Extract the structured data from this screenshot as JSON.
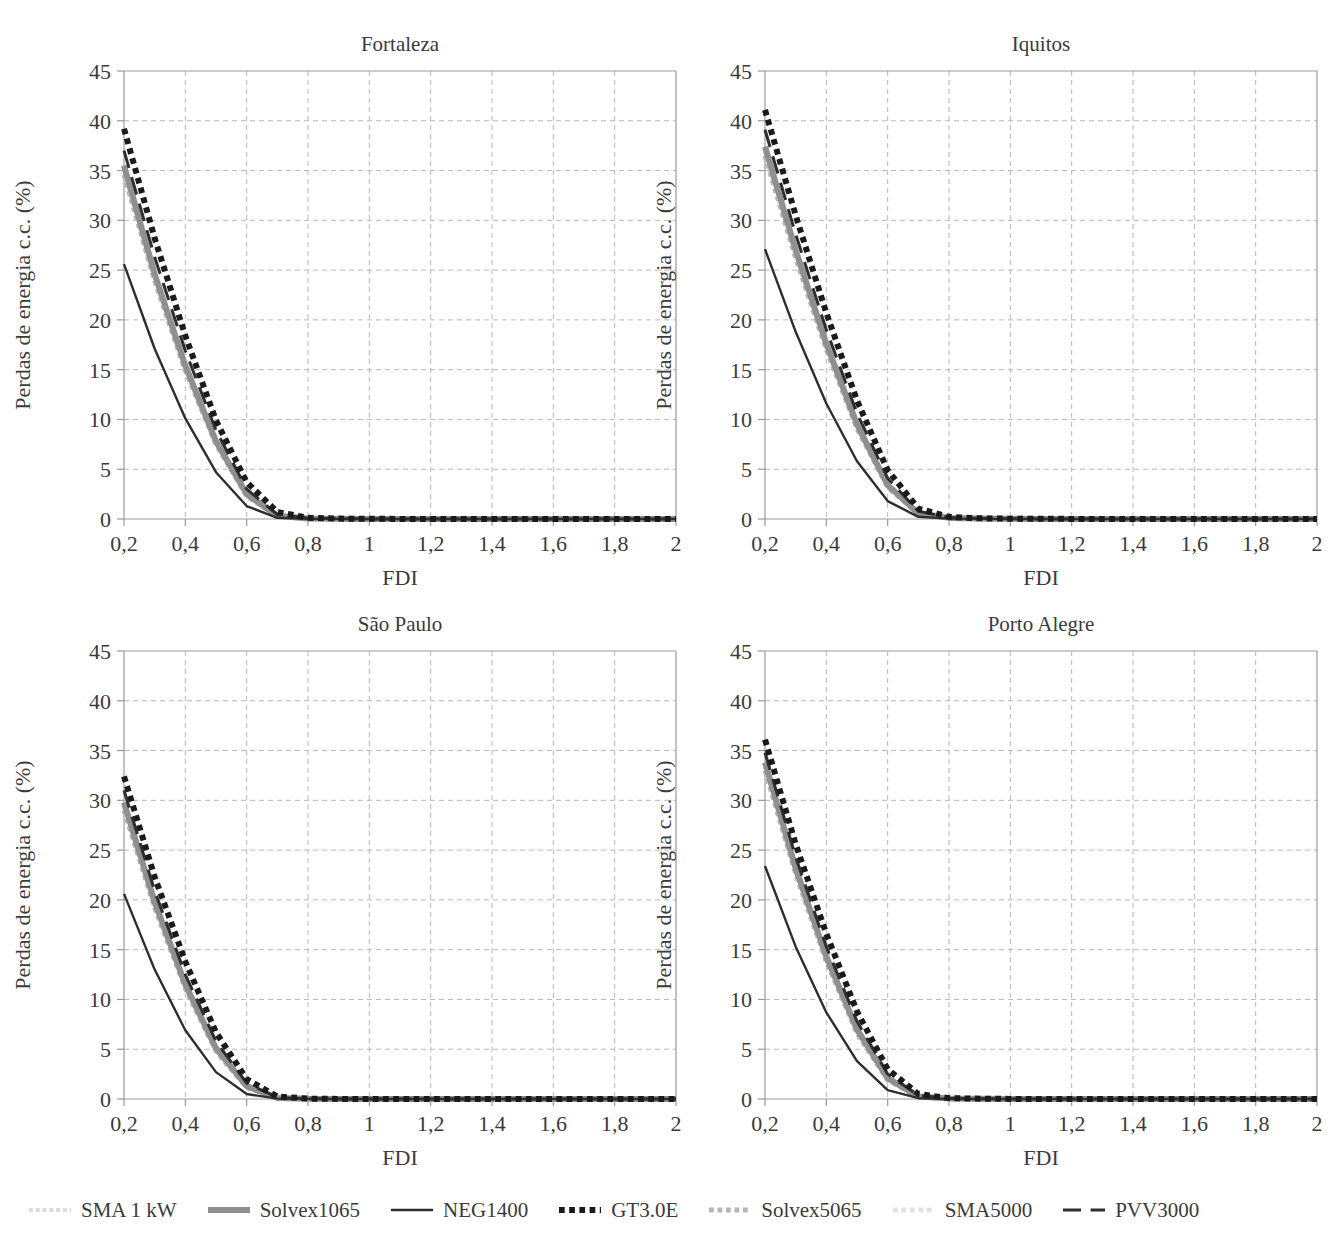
{
  "figure": {
    "background": "#ffffff",
    "axis_color": "#9a9a9a",
    "grid_color": "#b9b9b9",
    "text_color": "#3b3b3b"
  },
  "legend": {
    "position": "bottom",
    "items": [
      {
        "label": "SMA 1 kW",
        "color": "#d9d9d9",
        "style": "dotted",
        "width": 4
      },
      {
        "label": "Solvex1065",
        "color": "#8f8f8f",
        "style": "solid",
        "width": 6
      },
      {
        "label": "NEG1400",
        "color": "#2e2e2e",
        "style": "solid",
        "width": 2.4
      },
      {
        "label": "GT3.0E",
        "color": "#1a1a1a",
        "style": "dotted",
        "width": 6
      },
      {
        "label": "Solvex5065",
        "color": "#b5b5b5",
        "style": "dotted",
        "width": 5
      },
      {
        "label": "SMA5000",
        "color": "#e2e2e2",
        "style": "dotted",
        "width": 5
      },
      {
        "label": "PVV3000",
        "color": "#2e2e2e",
        "style": "dashed",
        "width": 3
      }
    ]
  },
  "chart_data": [
    {
      "type": "line",
      "title": "Fortaleza",
      "xlabel": "FDI",
      "ylabel": "Perdas de energia c.c. (%)",
      "xlim": [
        0.2,
        2.0
      ],
      "ylim": [
        0,
        45
      ],
      "xticks": [
        0.2,
        0.4,
        0.6,
        0.8,
        1.0,
        1.2,
        1.4,
        1.6,
        1.8,
        2.0
      ],
      "xticklabels": [
        "0,2",
        "0,4",
        "0,6",
        "0,8",
        "1",
        "1,2",
        "1,4",
        "1,6",
        "1,8",
        "2"
      ],
      "yticks": [
        0,
        5,
        10,
        15,
        20,
        25,
        30,
        35,
        40,
        45
      ],
      "yticklabels": [
        "0",
        "5",
        "10",
        "15",
        "20",
        "25",
        "30",
        "35",
        "40",
        "45"
      ],
      "grid": true,
      "x": [
        0.2,
        0.3,
        0.4,
        0.5,
        0.6,
        0.7,
        0.8,
        0.9,
        1.0,
        1.1,
        1.2,
        1.3,
        1.4,
        1.5,
        1.6,
        1.7,
        1.8,
        1.9,
        2.0
      ],
      "series": [
        {
          "name": "SMA 1 kW",
          "values": [
            35.0,
            24.2,
            15.1,
            7.6,
            2.4,
            0.3,
            0.05,
            0.02,
            0.01,
            0.01,
            0.0,
            0.0,
            0.0,
            0.0,
            0.0,
            0.0,
            0.0,
            0.0,
            0.0
          ]
        },
        {
          "name": "Solvex1065",
          "values": [
            35.5,
            24.6,
            15.4,
            7.8,
            2.5,
            0.32,
            0.06,
            0.02,
            0.01,
            0.01,
            0.0,
            0.0,
            0.0,
            0.0,
            0.0,
            0.0,
            0.0,
            0.0,
            0.0
          ]
        },
        {
          "name": "NEG1400",
          "values": [
            25.6,
            17.1,
            10.1,
            4.7,
            1.3,
            0.12,
            0.02,
            0.01,
            0.0,
            0.0,
            0.0,
            0.0,
            0.0,
            0.0,
            0.0,
            0.0,
            0.0,
            0.0,
            0.0
          ]
        },
        {
          "name": "GT3.0E",
          "values": [
            39.2,
            28.2,
            18.4,
            9.9,
            3.7,
            0.7,
            0.12,
            0.04,
            0.02,
            0.01,
            0.01,
            0.0,
            0.0,
            0.0,
            0.0,
            0.0,
            0.0,
            0.0,
            0.0
          ]
        },
        {
          "name": "Solvex5065",
          "values": [
            34.6,
            23.9,
            14.9,
            7.5,
            2.3,
            0.28,
            0.05,
            0.02,
            0.01,
            0.0,
            0.0,
            0.0,
            0.0,
            0.0,
            0.0,
            0.0,
            0.0,
            0.0,
            0.0
          ]
        },
        {
          "name": "SMA5000",
          "values": [
            35.2,
            24.4,
            15.2,
            7.7,
            2.45,
            0.31,
            0.05,
            0.02,
            0.01,
            0.01,
            0.0,
            0.0,
            0.0,
            0.0,
            0.0,
            0.0,
            0.0,
            0.0,
            0.0
          ]
        },
        {
          "name": "PVV3000",
          "values": [
            37.0,
            26.3,
            16.9,
            8.9,
            3.0,
            0.45,
            0.08,
            0.03,
            0.01,
            0.01,
            0.0,
            0.0,
            0.0,
            0.0,
            0.0,
            0.0,
            0.0,
            0.0,
            0.0
          ]
        }
      ]
    },
    {
      "type": "line",
      "title": "Iquitos",
      "xlabel": "FDI",
      "ylabel": "Perdas de energia c.c. (%)",
      "xlim": [
        0.2,
        2.0
      ],
      "ylim": [
        0,
        45
      ],
      "xticks": [
        0.2,
        0.4,
        0.6,
        0.8,
        1.0,
        1.2,
        1.4,
        1.6,
        1.8,
        2.0
      ],
      "xticklabels": [
        "0,2",
        "0,4",
        "0,6",
        "0,8",
        "1",
        "1,2",
        "1,4",
        "1,6",
        "1,8",
        "2"
      ],
      "yticks": [
        0,
        5,
        10,
        15,
        20,
        25,
        30,
        35,
        40,
        45
      ],
      "yticklabels": [
        "0",
        "5",
        "10",
        "15",
        "20",
        "25",
        "30",
        "35",
        "40",
        "45"
      ],
      "grid": true,
      "x": [
        0.2,
        0.3,
        0.4,
        0.5,
        0.6,
        0.7,
        0.8,
        0.9,
        1.0,
        1.1,
        1.2,
        1.3,
        1.4,
        1.5,
        1.6,
        1.7,
        1.8,
        1.9,
        2.0
      ],
      "series": [
        {
          "name": "SMA 1 kW",
          "values": [
            37.0,
            26.6,
            17.3,
            9.3,
            3.3,
            0.55,
            0.1,
            0.03,
            0.02,
            0.01,
            0.01,
            0.0,
            0.0,
            0.0,
            0.0,
            0.0,
            0.0,
            0.0,
            0.0
          ]
        },
        {
          "name": "Solvex1065",
          "values": [
            37.4,
            27.0,
            17.6,
            9.5,
            3.4,
            0.58,
            0.11,
            0.04,
            0.02,
            0.01,
            0.01,
            0.0,
            0.0,
            0.0,
            0.0,
            0.0,
            0.0,
            0.0,
            0.0
          ]
        },
        {
          "name": "NEG1400",
          "values": [
            27.1,
            18.8,
            11.6,
            5.8,
            1.8,
            0.22,
            0.04,
            0.01,
            0.01,
            0.0,
            0.0,
            0.0,
            0.0,
            0.0,
            0.0,
            0.0,
            0.0,
            0.0,
            0.0
          ]
        },
        {
          "name": "GT3.0E",
          "values": [
            41.1,
            30.5,
            20.7,
            11.9,
            4.9,
            1.05,
            0.22,
            0.07,
            0.03,
            0.02,
            0.01,
            0.01,
            0.0,
            0.0,
            0.0,
            0.0,
            0.0,
            0.0,
            0.0
          ]
        },
        {
          "name": "Solvex5065",
          "values": [
            36.5,
            26.2,
            17.0,
            9.1,
            3.2,
            0.52,
            0.09,
            0.03,
            0.01,
            0.01,
            0.0,
            0.0,
            0.0,
            0.0,
            0.0,
            0.0,
            0.0,
            0.0,
            0.0
          ]
        },
        {
          "name": "SMA5000",
          "values": [
            37.2,
            26.8,
            17.4,
            9.4,
            3.35,
            0.56,
            0.1,
            0.03,
            0.02,
            0.01,
            0.0,
            0.0,
            0.0,
            0.0,
            0.0,
            0.0,
            0.0,
            0.0,
            0.0
          ]
        },
        {
          "name": "PVV3000",
          "values": [
            39.1,
            28.6,
            19.0,
            10.6,
            4.1,
            0.78,
            0.15,
            0.05,
            0.02,
            0.01,
            0.01,
            0.0,
            0.0,
            0.0,
            0.0,
            0.0,
            0.0,
            0.0,
            0.0
          ]
        }
      ]
    },
    {
      "type": "line",
      "title": "São Paulo",
      "xlabel": "FDI",
      "ylabel": "Perdas de energia c.c. (%)",
      "xlim": [
        0.2,
        2.0
      ],
      "ylim": [
        0,
        45
      ],
      "xticks": [
        0.2,
        0.4,
        0.6,
        0.8,
        1.0,
        1.2,
        1.4,
        1.6,
        1.8,
        2.0
      ],
      "xticklabels": [
        "0,2",
        "0,4",
        "0,6",
        "0,8",
        "1",
        "1,2",
        "1,4",
        "1,6",
        "1,8",
        "2"
      ],
      "yticks": [
        0,
        5,
        10,
        15,
        20,
        25,
        30,
        35,
        40,
        45
      ],
      "yticklabels": [
        "0",
        "5",
        "10",
        "15",
        "20",
        "25",
        "30",
        "35",
        "40",
        "45"
      ],
      "grid": true,
      "x": [
        0.2,
        0.3,
        0.4,
        0.5,
        0.6,
        0.7,
        0.8,
        0.9,
        1.0,
        1.1,
        1.2,
        1.3,
        1.4,
        1.5,
        1.6,
        1.7,
        1.8,
        1.9,
        2.0
      ],
      "series": [
        {
          "name": "SMA 1 kW",
          "values": [
            29.4,
            19.5,
            11.3,
            4.9,
            1.2,
            0.1,
            0.02,
            0.01,
            0.0,
            0.0,
            0.0,
            0.0,
            0.0,
            0.0,
            0.0,
            0.0,
            0.0,
            0.0,
            0.0
          ]
        },
        {
          "name": "Solvex1065",
          "values": [
            29.8,
            19.8,
            11.5,
            5.1,
            1.3,
            0.11,
            0.02,
            0.01,
            0.0,
            0.0,
            0.0,
            0.0,
            0.0,
            0.0,
            0.0,
            0.0,
            0.0,
            0.0,
            0.0
          ]
        },
        {
          "name": "NEG1400",
          "values": [
            20.6,
            13.0,
            6.9,
            2.7,
            0.5,
            0.04,
            0.01,
            0.0,
            0.0,
            0.0,
            0.0,
            0.0,
            0.0,
            0.0,
            0.0,
            0.0,
            0.0,
            0.0,
            0.0
          ]
        },
        {
          "name": "GT3.0E",
          "values": [
            32.4,
            22.3,
            13.8,
            6.7,
            2.0,
            0.25,
            0.04,
            0.01,
            0.01,
            0.0,
            0.0,
            0.0,
            0.0,
            0.0,
            0.0,
            0.0,
            0.0,
            0.0,
            0.0
          ]
        },
        {
          "name": "Solvex5065",
          "values": [
            29.0,
            19.2,
            11.1,
            4.8,
            1.15,
            0.09,
            0.02,
            0.01,
            0.0,
            0.0,
            0.0,
            0.0,
            0.0,
            0.0,
            0.0,
            0.0,
            0.0,
            0.0,
            0.0
          ]
        },
        {
          "name": "SMA5000",
          "values": [
            29.6,
            19.6,
            11.4,
            5.0,
            1.25,
            0.1,
            0.02,
            0.01,
            0.0,
            0.0,
            0.0,
            0.0,
            0.0,
            0.0,
            0.0,
            0.0,
            0.0,
            0.0,
            0.0
          ]
        },
        {
          "name": "PVV3000",
          "values": [
            31.0,
            20.9,
            12.5,
            5.8,
            1.6,
            0.16,
            0.03,
            0.01,
            0.0,
            0.0,
            0.0,
            0.0,
            0.0,
            0.0,
            0.0,
            0.0,
            0.0,
            0.0,
            0.0
          ]
        }
      ]
    },
    {
      "type": "line",
      "title": "Porto Alegre",
      "xlabel": "FDI",
      "ylabel": "Perdas de energia c.c. (%)",
      "xlim": [
        0.2,
        2.0
      ],
      "ylim": [
        0,
        45
      ],
      "xticks": [
        0.2,
        0.4,
        0.6,
        0.8,
        1.0,
        1.2,
        1.4,
        1.6,
        1.8,
        2.0
      ],
      "xticklabels": [
        "0,2",
        "0,4",
        "0,6",
        "0,8",
        "1",
        "1,2",
        "1,4",
        "1,6",
        "1,8",
        "2"
      ],
      "yticks": [
        0,
        5,
        10,
        15,
        20,
        25,
        30,
        35,
        40,
        45
      ],
      "yticklabels": [
        "0",
        "5",
        "10",
        "15",
        "20",
        "25",
        "30",
        "35",
        "40",
        "45"
      ],
      "grid": true,
      "x": [
        0.2,
        0.3,
        0.4,
        0.5,
        0.6,
        0.7,
        0.8,
        0.9,
        1.0,
        1.1,
        1.2,
        1.3,
        1.4,
        1.5,
        1.6,
        1.7,
        1.8,
        1.9,
        2.0
      ],
      "series": [
        {
          "name": "SMA 1 kW",
          "values": [
            33.4,
            22.9,
            14.0,
            6.8,
            2.0,
            0.24,
            0.04,
            0.01,
            0.01,
            0.0,
            0.0,
            0.0,
            0.0,
            0.0,
            0.0,
            0.0,
            0.0,
            0.0,
            0.0
          ]
        },
        {
          "name": "Solvex1065",
          "values": [
            33.8,
            23.2,
            14.3,
            7.0,
            2.1,
            0.26,
            0.05,
            0.02,
            0.01,
            0.0,
            0.0,
            0.0,
            0.0,
            0.0,
            0.0,
            0.0,
            0.0,
            0.0,
            0.0
          ]
        },
        {
          "name": "NEG1400",
          "values": [
            23.4,
            15.3,
            8.7,
            3.8,
            0.9,
            0.08,
            0.01,
            0.0,
            0.0,
            0.0,
            0.0,
            0.0,
            0.0,
            0.0,
            0.0,
            0.0,
            0.0,
            0.0,
            0.0
          ]
        },
        {
          "name": "GT3.0E",
          "values": [
            36.1,
            25.6,
            16.6,
            8.8,
            3.0,
            0.5,
            0.09,
            0.03,
            0.01,
            0.01,
            0.0,
            0.0,
            0.0,
            0.0,
            0.0,
            0.0,
            0.0,
            0.0,
            0.0
          ]
        },
        {
          "name": "Solvex5065",
          "values": [
            33.0,
            22.6,
            13.8,
            6.6,
            1.9,
            0.22,
            0.04,
            0.01,
            0.0,
            0.0,
            0.0,
            0.0,
            0.0,
            0.0,
            0.0,
            0.0,
            0.0,
            0.0,
            0.0
          ]
        },
        {
          "name": "SMA5000",
          "values": [
            33.6,
            23.0,
            14.1,
            6.9,
            2.05,
            0.25,
            0.04,
            0.01,
            0.01,
            0.0,
            0.0,
            0.0,
            0.0,
            0.0,
            0.0,
            0.0,
            0.0,
            0.0,
            0.0
          ]
        },
        {
          "name": "PVV3000",
          "values": [
            34.8,
            24.3,
            15.3,
            7.8,
            2.5,
            0.36,
            0.06,
            0.02,
            0.01,
            0.0,
            0.0,
            0.0,
            0.0,
            0.0,
            0.0,
            0.0,
            0.0,
            0.0,
            0.0
          ]
        }
      ]
    }
  ]
}
